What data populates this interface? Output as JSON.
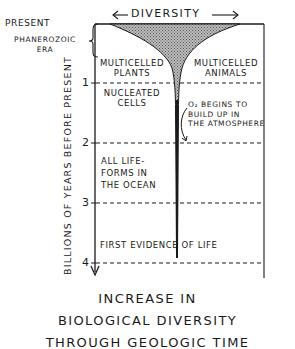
{
  "diagram": {
    "top_axis": {
      "label": "DIVERSITY",
      "left_arrow": "←",
      "right_arrow": "→"
    },
    "y_axis": {
      "label": "BILLIONS OF YEARS BEFORE PRESENT",
      "top_label": "PRESENT",
      "ticks": [
        "1",
        "2",
        "3",
        "4"
      ]
    },
    "era": {
      "label_line1": "PHANEROZOIC",
      "label_line2": "ERA"
    },
    "regions": {
      "multicelled_plants": {
        "line1": "MULTICELLED",
        "line2": "PLANTS"
      },
      "multicelled_animals": {
        "line1": "MULTICELLED",
        "line2": "ANIMALS"
      },
      "nucleated_cells": {
        "line1": "NUCLEATED",
        "line2": "CELLS"
      },
      "oxygen": {
        "line1": "O₂ BEGINS TO",
        "line2": "BUILD UP IN",
        "line3": "THE ATMOSPHERE"
      },
      "ocean": {
        "line1": "ALL LIFE-",
        "line2": "FORMS IN",
        "line3": "THE OCEAN"
      },
      "first_life": {
        "line1": "FIRST EVIDENCE OF LIFE"
      }
    },
    "caption": {
      "line1": "INCREASE IN",
      "line2": "BIOLOGICAL DIVERSITY",
      "line3": "THROUGH GEOLOGIC TIME"
    },
    "colors": {
      "ink": "#1a1a1a",
      "fill": "#9a9a9a",
      "background": "#ffffff"
    }
  }
}
